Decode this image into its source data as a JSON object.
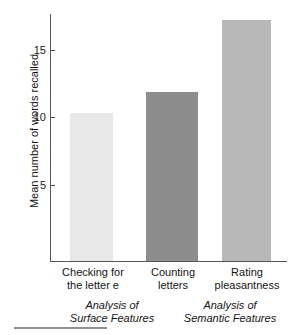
{
  "figure": {
    "name": "mean-words-recalled-bar-chart",
    "top_clipped_text": "",
    "background_color": "#ffffff",
    "axis_color": "#555555",
    "text_color": "#141414",
    "bottom_rule_color": "#8f8f8f"
  },
  "chart_data": {
    "type": "bar",
    "title": "",
    "xlabel": "",
    "ylabel": "Mean number of words recalled",
    "categories": [
      "Checking for the letter e",
      "Counting letters",
      "Rating pleasantness"
    ],
    "category_lines": [
      [
        "Checking for",
        "the letter e"
      ],
      [
        "Counting",
        "letters"
      ],
      [
        "Rating",
        "pleasantness"
      ]
    ],
    "values": [
      10.3,
      11.9,
      17.2
    ],
    "bar_colors": [
      "#e8e8e8",
      "#8d8d8d",
      "#b8b8b8"
    ],
    "ylim": [
      0,
      18
    ],
    "yticks": [
      5,
      10,
      15
    ],
    "ytick_labels": [
      "5",
      "10",
      "15"
    ],
    "grid": false,
    "legend": "none",
    "groups": [
      {
        "lines": [
          "Analysis of",
          "Surface Features"
        ],
        "label": "Analysis of Surface Features",
        "categories": [
          "Checking for the letter e",
          "Counting letters"
        ]
      },
      {
        "lines": [
          "Analysis of",
          "Semantic Features"
        ],
        "label": "Analysis of Semantic Features",
        "categories": [
          "Rating pleasantness"
        ]
      }
    ]
  }
}
